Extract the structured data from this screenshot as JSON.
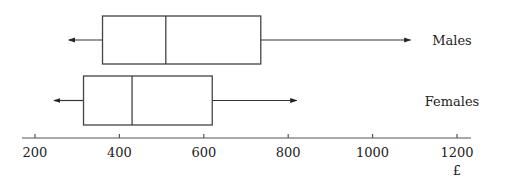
{
  "chart_data": {
    "type": "boxplot",
    "title": "",
    "xlabel": "£",
    "ylabel": "",
    "xlim": [
      185,
      1230
    ],
    "xticks": [
      200,
      400,
      600,
      800,
      1000,
      1200
    ],
    "xtick_labels": [
      "200",
      "400",
      "600",
      "800",
      "1000",
      "1200"
    ],
    "grid": false,
    "whisker_style": "arrow",
    "series": [
      {
        "name": "Males",
        "min": 280,
        "q1": 360,
        "median": 510,
        "q3": 735,
        "max": 1090
      },
      {
        "name": "Females",
        "min": 245,
        "q1": 315,
        "median": 430,
        "q3": 620,
        "max": 820
      }
    ]
  }
}
